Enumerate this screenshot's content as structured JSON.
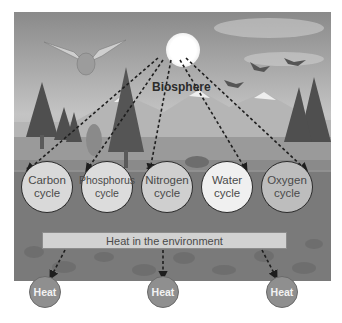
{
  "diagram": {
    "central_label": "Biosphere",
    "source_icon": "sun",
    "cycles": [
      {
        "label_line1": "Carbon",
        "label_line2": "cycle",
        "fill": "#d9d9d9"
      },
      {
        "label_line1": "Phosphorus",
        "label_line2": "cycle",
        "fill": "#dcdcdc"
      },
      {
        "label_line1": "Nitrogen",
        "label_line2": "cycle",
        "fill": "#cfcfcf"
      },
      {
        "label_line1": "Water",
        "label_line2": "cycle",
        "fill": "#f0f0f0"
      },
      {
        "label_line1": "Oxygen",
        "label_line2": "cycle",
        "fill": "#bdbdbd"
      }
    ],
    "environment_bar": "Heat in the environment",
    "heat_nodes": [
      "Heat",
      "Heat",
      "Heat"
    ],
    "colors": {
      "arrow": "#1e1e1e",
      "heat_node_fill": "#8f8f8f",
      "environment_bar_fill": "#d2d2d2"
    }
  }
}
